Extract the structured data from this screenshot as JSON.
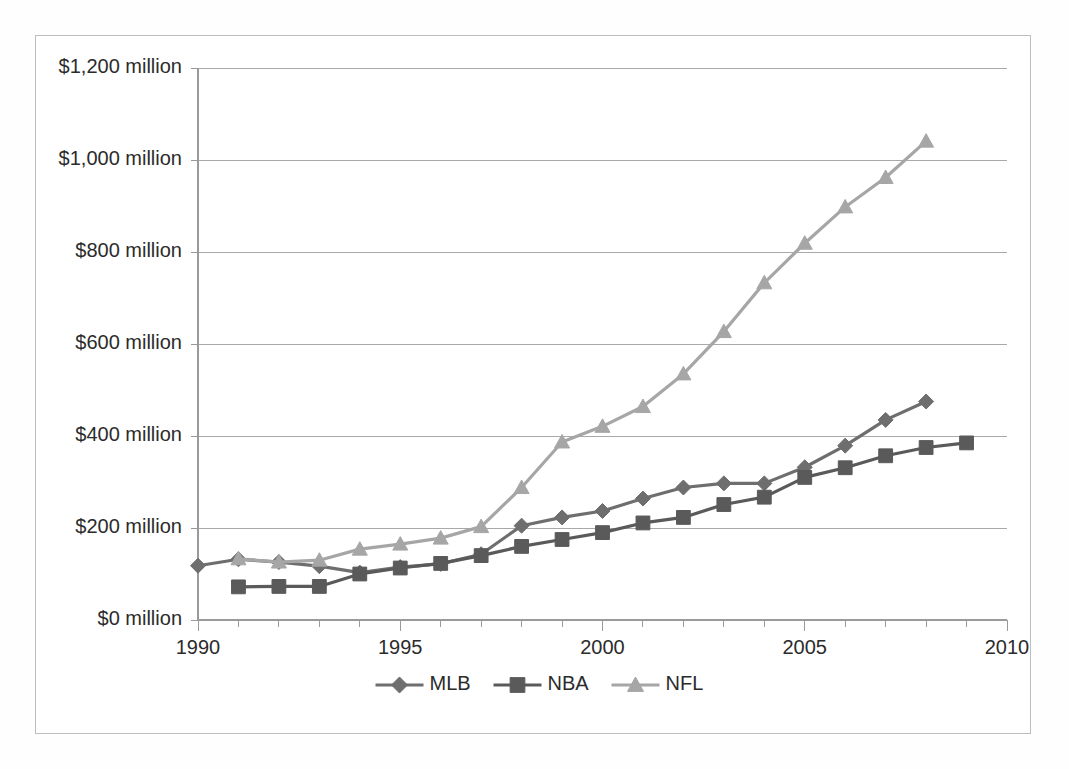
{
  "chart_data": {
    "type": "line",
    "title": "",
    "subtitle": "",
    "xlabel": "",
    "ylabel": "",
    "xlim": [
      1990,
      2010
    ],
    "ylim": [
      0,
      1200
    ],
    "x_tick_labels": [
      "1990",
      "1995",
      "2000",
      "2005",
      "2010"
    ],
    "x_tick_values": [
      1990,
      1995,
      2000,
      2005,
      2010
    ],
    "y_tick_labels": [
      "$0 million",
      "$200 million",
      "$400 million",
      "$600 million",
      "$800 million",
      "$1,000 million",
      "$1,200 million"
    ],
    "y_tick_values": [
      0,
      200,
      400,
      600,
      800,
      1000,
      1200
    ],
    "grid": "horizontal",
    "minor_x_ticks": true,
    "legend_position": "bottom",
    "series": [
      {
        "name": "MLB",
        "marker": "diamond",
        "color": "#6e6e6e",
        "x": [
          1990,
          1991,
          1992,
          1993,
          1994,
          1995,
          1996,
          1997,
          1998,
          1999,
          2000,
          2001,
          2002,
          2003,
          2004,
          2005,
          2006,
          2007,
          2008
        ],
        "values": [
          118,
          132,
          126,
          117,
          103,
          115,
          122,
          143,
          205,
          223,
          237,
          264,
          288,
          297,
          297,
          332,
          379,
          435,
          475
        ]
      },
      {
        "name": "NBA",
        "marker": "square",
        "color": "#5a5a5a",
        "x": [
          1991,
          1992,
          1993,
          1994,
          1995,
          1996,
          1997,
          1998,
          1999,
          2000,
          2001,
          2002,
          2003,
          2004,
          2005,
          2006,
          2007,
          2008,
          2009
        ],
        "values": [
          72,
          73,
          73,
          100,
          113,
          123,
          140,
          160,
          175,
          190,
          211,
          223,
          251,
          267,
          310,
          331,
          357,
          375,
          385
        ]
      },
      {
        "name": "NFL",
        "marker": "triangle",
        "color": "#a6a6a6",
        "x": [
          1991,
          1992,
          1993,
          1994,
          1995,
          1996,
          1997,
          1998,
          1999,
          2000,
          2001,
          2002,
          2003,
          2004,
          2005,
          2006,
          2007,
          2008
        ],
        "values": [
          133,
          126,
          130,
          154,
          165,
          178,
          203,
          288,
          387,
          421,
          464,
          535,
          627,
          733,
          819,
          898,
          962,
          1041
        ]
      }
    ]
  },
  "legend": {
    "items": [
      {
        "label": "MLB",
        "marker": "diamond",
        "color": "#6e6e6e"
      },
      {
        "label": "NBA",
        "marker": "square",
        "color": "#5a5a5a"
      },
      {
        "label": "NFL",
        "marker": "triangle",
        "color": "#a6a6a6"
      }
    ]
  },
  "colors": {
    "grid": "#a9a9a9",
    "axis": "#9a9a9a",
    "frame_border": "#bdbdbd",
    "text": "#2b2b2b",
    "background": "#ffffff"
  }
}
